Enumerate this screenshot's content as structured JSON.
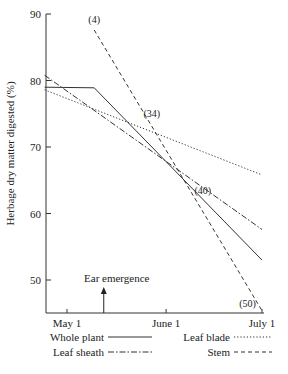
{
  "chart_data": {
    "type": "line",
    "title": "",
    "xlabel": "",
    "ylabel": "Herbage dry matter digested (%)",
    "ylim": [
      45,
      90
    ],
    "yticks": [
      50,
      60,
      70,
      80,
      90
    ],
    "xlim_days": [
      -7,
      61
    ],
    "xticks": [
      {
        "day": 0,
        "label": "May 1"
      },
      {
        "day": 31,
        "label": "June 1"
      },
      {
        "day": 61,
        "label": "July 1"
      }
    ],
    "grid": false,
    "series": [
      {
        "name": "Whole plant",
        "style": "solid",
        "points": [
          [
            -7,
            79.0
          ],
          [
            8.5,
            78.9
          ],
          [
            61,
            53.0
          ]
        ]
      },
      {
        "name": "Leaf blade",
        "style": "dotted",
        "points": [
          [
            -7,
            78.6
          ],
          [
            61,
            65.8
          ]
        ]
      },
      {
        "name": "Leaf sheath",
        "style": "dashdot",
        "points": [
          [
            -7,
            80.8
          ],
          [
            61,
            57.6
          ]
        ]
      },
      {
        "name": "Stem",
        "style": "dashed",
        "points": [
          [
            8.5,
            87.6
          ],
          [
            61,
            45.4
          ]
        ]
      }
    ],
    "annotations": [
      {
        "text": "(4)",
        "day": 8.5,
        "value": 88.6
      },
      {
        "text": "(34)",
        "day": 26.5,
        "value": 74.5
      },
      {
        "text": "(40)",
        "day": 42.5,
        "value": 63.0
      },
      {
        "text": "(50)",
        "day": 56.5,
        "value": 46.0
      }
    ],
    "event": {
      "label": "Ear emergence",
      "day": 11.5
    },
    "legend": {
      "placement": "bottom",
      "entries": [
        {
          "name": "Whole plant",
          "style": "solid"
        },
        {
          "name": "Leaf blade",
          "style": "dotted"
        },
        {
          "name": "Leaf sheath",
          "style": "dashdot"
        },
        {
          "name": "Stem",
          "style": "dashed"
        }
      ]
    }
  }
}
